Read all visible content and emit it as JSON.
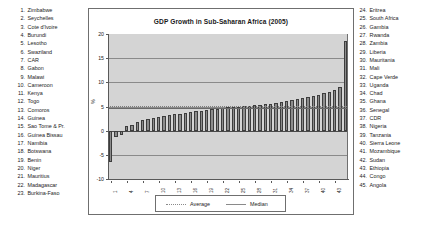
{
  "chart": {
    "title": "GDP Growth in Sub-Saharan Africa (2005)",
    "ylabel": "%"
  },
  "left_list": [
    {
      "num": "1.",
      "name": "Zimbabwe"
    },
    {
      "num": "2.",
      "name": "Seychelles"
    },
    {
      "num": "3.",
      "name": "Cote d'Ivoire"
    },
    {
      "num": "4.",
      "name": "Burundi"
    },
    {
      "num": "5.",
      "name": "Lesotho"
    },
    {
      "num": "6.",
      "name": "Swaziland"
    },
    {
      "num": "7.",
      "name": "CAR"
    },
    {
      "num": "8.",
      "name": "Gabon"
    },
    {
      "num": "9.",
      "name": "Malawi"
    },
    {
      "num": "10.",
      "name": "Cameroon"
    },
    {
      "num": "11.",
      "name": "Kenya"
    },
    {
      "num": "12.",
      "name": "Togo"
    },
    {
      "num": "13.",
      "name": "Comoros"
    },
    {
      "num": "14.",
      "name": "Guinea"
    },
    {
      "num": "15.",
      "name": "Sao Tome & Pr."
    },
    {
      "num": "16.",
      "name": "Guinea Bissau"
    },
    {
      "num": "17.",
      "name": "Namibia"
    },
    {
      "num": "18.",
      "name": "Botswana"
    },
    {
      "num": "19.",
      "name": "Benin"
    },
    {
      "num": "20.",
      "name": "Niger"
    },
    {
      "num": "21.",
      "name": "Mauritius"
    },
    {
      "num": "22.",
      "name": "Madagascar"
    },
    {
      "num": "23.",
      "name": "Burkina-Faso"
    }
  ],
  "right_list": [
    {
      "num": "24.",
      "name": "Eritrea"
    },
    {
      "num": "25.",
      "name": "South Africa"
    },
    {
      "num": "26.",
      "name": "Gambia"
    },
    {
      "num": "27.",
      "name": "Rwanda"
    },
    {
      "num": "28.",
      "name": "Zambia"
    },
    {
      "num": "29.",
      "name": "Liberia"
    },
    {
      "num": "30.",
      "name": "Mauritania"
    },
    {
      "num": "31.",
      "name": "Mali"
    },
    {
      "num": "32.",
      "name": "Cape Verde"
    },
    {
      "num": "33.",
      "name": "Uganda"
    },
    {
      "num": "34.",
      "name": "Chad"
    },
    {
      "num": "35.",
      "name": "Ghana"
    },
    {
      "num": "36.",
      "name": "Senegal"
    },
    {
      "num": "37.",
      "name": "CDR"
    },
    {
      "num": "38.",
      "name": "Nigeria"
    },
    {
      "num": "39.",
      "name": "Tanzania"
    },
    {
      "num": "40.",
      "name": "Sierra Leone"
    },
    {
      "num": "41.",
      "name": "Mozambique"
    },
    {
      "num": "42.",
      "name": "Sudan"
    },
    {
      "num": "43.",
      "name": "Ethiopia"
    },
    {
      "num": "44.",
      "name": "Congo"
    },
    {
      "num": "45.",
      "name": "Angola"
    }
  ],
  "chart_data": {
    "type": "bar",
    "title": "GDP Growth in Sub-Saharan Africa (2005)",
    "xlabel": "",
    "ylabel": "%",
    "ylim": [
      -10,
      20
    ],
    "yticks": [
      20,
      15,
      10,
      5,
      0,
      -5,
      -10
    ],
    "ytick_labels": [
      "20",
      "15",
      "10",
      "5",
      "0",
      "-5",
      "-10"
    ],
    "grid": true,
    "legend_position": "bottom",
    "categories": [
      "1",
      "2",
      "3",
      "4",
      "5",
      "6",
      "7",
      "8",
      "9",
      "10",
      "11",
      "12",
      "13",
      "14",
      "15",
      "16",
      "17",
      "18",
      "19",
      "20",
      "21",
      "22",
      "23",
      "24",
      "25",
      "26",
      "27",
      "28",
      "29",
      "30",
      "31",
      "32",
      "33",
      "34",
      "35",
      "36",
      "37",
      "38",
      "39",
      "40",
      "41",
      "42",
      "43",
      "44",
      "45"
    ],
    "xtick_labels": [
      "1",
      "4",
      "7",
      "10",
      "13",
      "16",
      "19",
      "22",
      "25",
      "28",
      "31",
      "34",
      "37",
      "40",
      "43"
    ],
    "series": [
      {
        "name": "GDP growth",
        "values": [
          -6.5,
          -1.3,
          -1.0,
          0.9,
          1.2,
          1.8,
          2.2,
          2.4,
          2.6,
          2.9,
          3.0,
          3.2,
          3.4,
          3.5,
          3.7,
          3.8,
          4.0,
          4.1,
          4.3,
          4.4,
          4.5,
          4.6,
          4.8,
          4.9,
          5.0,
          5.1,
          5.2,
          5.3,
          5.4,
          5.5,
          5.6,
          5.8,
          6.0,
          6.2,
          6.4,
          6.6,
          6.8,
          7.0,
          7.2,
          7.4,
          7.7,
          8.0,
          8.5,
          9.0,
          18.6
        ]
      }
    ],
    "reference_lines": [
      {
        "label": "Average",
        "value": 5.2,
        "style": "dotted"
      },
      {
        "label": "Median",
        "value": 4.6,
        "style": "solid"
      }
    ],
    "legend": [
      {
        "label": "Average",
        "style": "dotted"
      },
      {
        "label": "Median",
        "style": "solid"
      }
    ]
  }
}
